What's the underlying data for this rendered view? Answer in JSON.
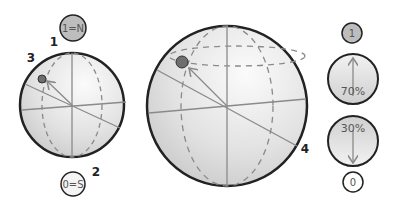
{
  "diagram": {
    "left_sphere": {
      "north_label": "1=N",
      "south_label": "0=S",
      "markers": {
        "m1": "1",
        "m2": "2",
        "m3": "3"
      }
    },
    "right_sphere": {
      "markers": {
        "m4": "4"
      }
    },
    "probability_panel": {
      "top_state": "1",
      "upper_pct": "70%",
      "lower_pct": "30%",
      "bottom_state": "0"
    },
    "colors": {
      "sphere_fill_light": "#f4f4f4",
      "sphere_fill_dark": "#cfcfcf",
      "outline": "#222222",
      "axis": "#8a8a8a",
      "point": "#6e6e6e"
    }
  }
}
